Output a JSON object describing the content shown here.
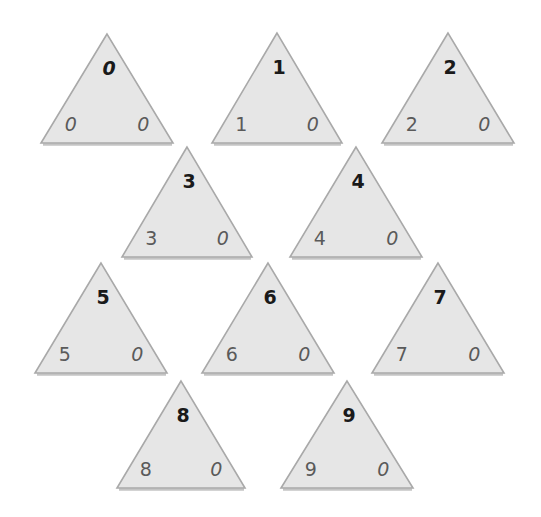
{
  "colors": {
    "fill": "#e6e6e6",
    "stroke": "#a9a9a9",
    "top_number": "#1a1a1a",
    "bottom_numbers": "#5a5a5a"
  },
  "triangles": [
    {
      "top": "0",
      "bottom_left": "0",
      "bottom_right": "0"
    },
    {
      "top": "1",
      "bottom_left": "1",
      "bottom_right": "0"
    },
    {
      "top": "2",
      "bottom_left": "2",
      "bottom_right": "0"
    },
    {
      "top": "3",
      "bottom_left": "3",
      "bottom_right": "0"
    },
    {
      "top": "4",
      "bottom_left": "4",
      "bottom_right": "0"
    },
    {
      "top": "5",
      "bottom_left": "5",
      "bottom_right": "0"
    },
    {
      "top": "6",
      "bottom_left": "6",
      "bottom_right": "0"
    },
    {
      "top": "7",
      "bottom_left": "7",
      "bottom_right": "0"
    },
    {
      "top": "8",
      "bottom_left": "8",
      "bottom_right": "0"
    },
    {
      "top": "9",
      "bottom_left": "9",
      "bottom_right": "0"
    }
  ]
}
